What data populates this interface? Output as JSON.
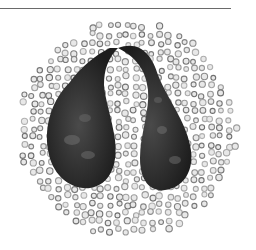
{
  "image": {
    "subject": "two pear-shaped dark organisms joined by a thin arched stalk surrounded by a circular field of small ring-shaped cells",
    "colors": {
      "background": "#ffffff",
      "rule": "#6a6a6a",
      "organism": "#2a2a2a",
      "cell_ring": "#8a8a8a"
    }
  }
}
